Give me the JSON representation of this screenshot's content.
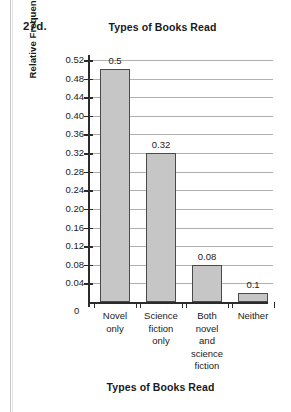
{
  "problem_number": "27d.",
  "chart_data": {
    "type": "bar",
    "title": "Types of Books Read",
    "xlabel": "Types of Books Read",
    "ylabel": "Relative Frequency (%)",
    "categories": [
      "Novel only",
      "Science fiction only",
      "Both novel and science fiction",
      "Neither"
    ],
    "category_lines": [
      [
        "Novel",
        "only"
      ],
      [
        "Science",
        "fiction",
        "only"
      ],
      [
        "Both",
        "novel",
        "and",
        "science",
        "fiction"
      ],
      [
        "Neither"
      ]
    ],
    "values": [
      0.5,
      0.32,
      0.08,
      0.1
    ],
    "value_labels": [
      "0.5",
      "0.32",
      "0.08",
      "0.1"
    ],
    "bar_drawn_heights": [
      0.5,
      0.32,
      0.08,
      0.02
    ],
    "ylim": [
      0,
      0.52
    ],
    "ytick_step": 0.04,
    "ytick_labels": [
      "0.52",
      "0.48",
      "0.44",
      "0.40",
      "0.36",
      "0.32",
      "0.28",
      "0.24",
      "0.20",
      "0.16",
      "0.12",
      "0.08",
      "0.04"
    ],
    "origin_label": "0",
    "grid": true,
    "legend": false,
    "bar_color": "#c6c6c6",
    "bar_border_color": "#4a4a4a",
    "grid_color": "#b0b0b0",
    "axis_color": "#2b2b2b"
  }
}
